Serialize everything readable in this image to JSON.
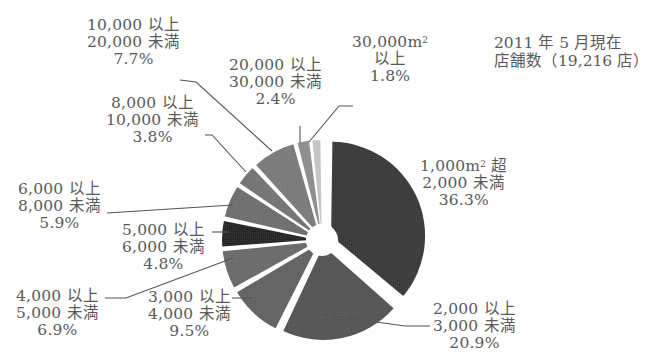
{
  "chart_data": {
    "type": "pie",
    "title": "",
    "note": [
      "2011 年 5 月現在",
      "店舗数（19,216 店）"
    ],
    "unit": "m²",
    "total_stores": 19216,
    "date": "2011年5月",
    "start_angle": "12 o'clock",
    "direction": "clockwise",
    "exploded": true,
    "categories": [
      "1,000m² 超 2,000 未満",
      "2,000 以上 3,000 未満",
      "3,000 以上 4,000 未満",
      "4,000 以上 5,000 未満",
      "5,000 以上 6,000 未満",
      "6,000 以上 8,000 未満",
      "8,000 以上 10,000 未満",
      "10,000 以上 20,000 未満",
      "20,000 以上 30,000 未満",
      "30,000m² 以上"
    ],
    "values": [
      36.3,
      20.9,
      9.5,
      6.9,
      4.8,
      5.9,
      3.8,
      7.7,
      2.4,
      1.8
    ],
    "colors": [
      "#3a3a3a",
      "#545454",
      "#626262",
      "#6a6a6a",
      "#262626",
      "#6e6e6e",
      "#747474",
      "#7a7a7a",
      "#8c8c8c",
      "#c4c4c4"
    ]
  },
  "labels": [
    {
      "line1": "1,000m",
      "sup": "2",
      "line1b": " 超",
      "line2": "2,000 未満",
      "pct": "36.3%"
    },
    {
      "line1": "2,000 以上",
      "line2": "3,000 未満",
      "pct": "20.9%"
    },
    {
      "line1": "3,000 以上",
      "line2": "4,000 未満",
      "pct": "9.5%"
    },
    {
      "line1": "4,000 以上",
      "line2": "5,000 未満",
      "pct": "6.9%"
    },
    {
      "line1": "5,000 以上",
      "line2": "6,000 未満",
      "pct": "4.8%"
    },
    {
      "line1": "6,000 以上",
      "line2": "8,000 未満",
      "pct": "5.9%"
    },
    {
      "line1": "8,000 以上",
      "line2": "10,000 未満",
      "pct": "3.8%"
    },
    {
      "line1": "10,000 以上",
      "line2": "20,000 未満",
      "pct": "7.7%"
    },
    {
      "line1": "20,000 以上",
      "line2": "30,000 未満",
      "pct": "2.4%"
    },
    {
      "line1": "30,000m",
      "sup": "2",
      "line2": "以上",
      "pct": "1.8%"
    }
  ],
  "note": {
    "line1": "2011 年 5 月現在",
    "line2": "店舗数（19,216 店）"
  }
}
